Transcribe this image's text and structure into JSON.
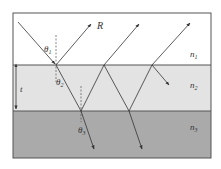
{
  "diagram": {
    "type": "thin-film-interference",
    "layers": [
      {
        "name": "n1",
        "label": "n",
        "sub": "1",
        "color": "#ffffff"
      },
      {
        "name": "n2",
        "label": "n",
        "sub": "2",
        "color": "#e3e3e3"
      },
      {
        "name": "n3",
        "label": "n",
        "sub": "3",
        "color": "#aaaaaa"
      }
    ],
    "labels": {
      "reflected": "R",
      "thickness": "t",
      "theta1": "θ",
      "theta1_sub": "1",
      "theta2": "θ",
      "theta2_sub": "2",
      "theta3": "θ",
      "theta3_sub": "3"
    },
    "colors": {
      "border": "#555555",
      "ray": "#333333"
    }
  }
}
